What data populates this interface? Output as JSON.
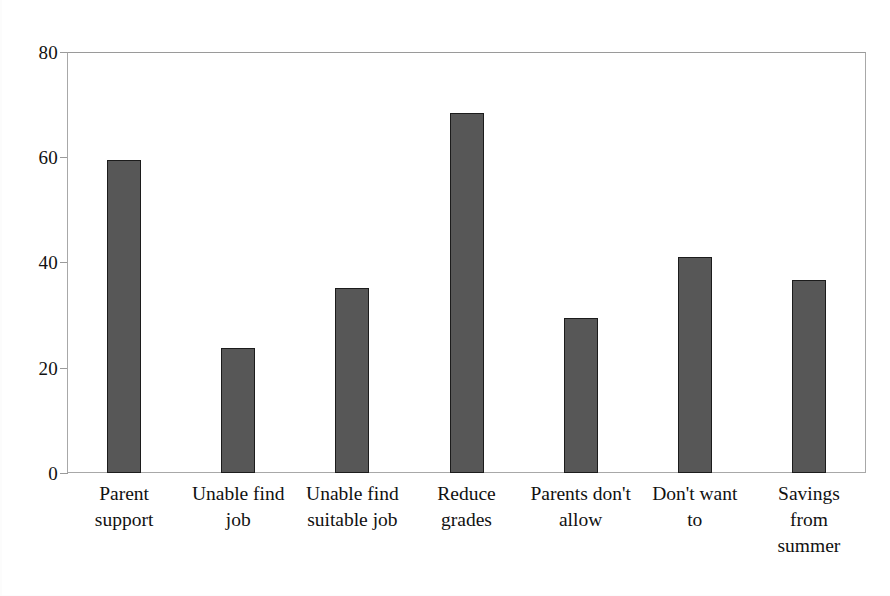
{
  "chart_data": {
    "type": "bar",
    "title": "",
    "subtitle": "",
    "xlabel": "",
    "ylabel": "",
    "categories": [
      "Parent support",
      "Unable find job",
      "Unable find suitable job",
      "Reduce grades",
      "Parents don't allow",
      "Don't want to",
      "Savings from summer"
    ],
    "category_lines": [
      [
        "Parent",
        "support"
      ],
      [
        "Unable find",
        "job"
      ],
      [
        "Unable find",
        "suitable job"
      ],
      [
        "Reduce",
        "grades"
      ],
      [
        "Parents don't",
        "allow"
      ],
      [
        "Don't want",
        "to"
      ],
      [
        "Savings",
        "from",
        "summer"
      ]
    ],
    "values": [
      59.5,
      23.8,
      35.1,
      68.5,
      29.4,
      41.1,
      36.6
    ],
    "ylim": [
      0,
      80
    ],
    "ytick_labels": [
      "80",
      "60",
      "40",
      "20",
      "0"
    ],
    "ytick_values": [
      80,
      60,
      40,
      20,
      0
    ],
    "grid": false,
    "legend": false,
    "legend_position": "none",
    "bar_fill_color": "#575757",
    "bar_border_color": "#1c1c1c",
    "axis_color": "#9a9a9a",
    "text_color": "#111111",
    "background_color": "#ffffff"
  }
}
